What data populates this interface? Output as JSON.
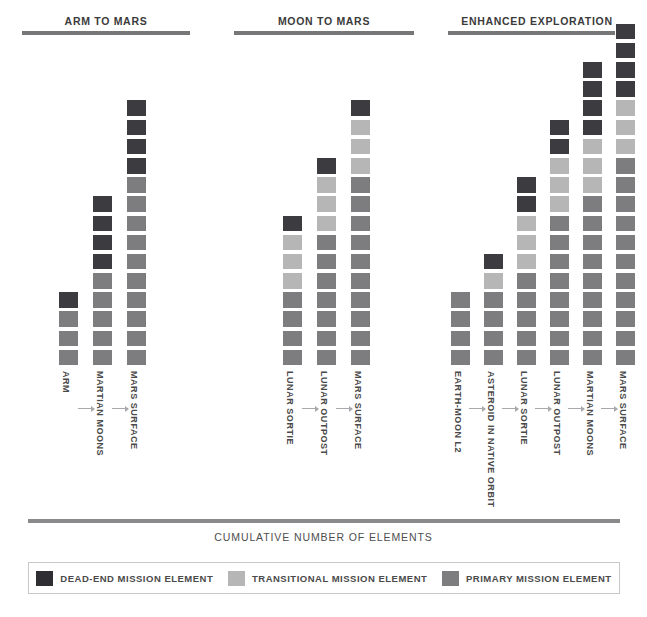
{
  "chart_data": {
    "type": "bar",
    "title": "",
    "xlabel": "CUMULATIVE NUMBER OF ELEMENTS",
    "ylabel": "",
    "stack_order_bottom_to_top": [
      "primary",
      "transitional",
      "deadend"
    ],
    "legend": {
      "position": "bottom",
      "entries": [
        {
          "key": "deadend",
          "label": "DEAD-END MISSION ELEMENT",
          "color": "#2f2f33"
        },
        {
          "key": "transitional",
          "label": "TRANSITIONAL MISSION ELEMENT",
          "color": "#b6b6b6"
        },
        {
          "key": "primary",
          "label": "PRIMARY MISSION ELEMENT",
          "color": "#7d7d7f"
        }
      ]
    },
    "groups": [
      {
        "title": "ARM TO MARS",
        "categories": [
          "ARM",
          "MARTIAN MOONS",
          "MARS SURFACE"
        ],
        "series": [
          {
            "name": "PRIMARY MISSION ELEMENT",
            "values": [
              3,
              5,
              10
            ]
          },
          {
            "name": "TRANSITIONAL MISSION ELEMENT",
            "values": [
              0,
              0,
              0
            ]
          },
          {
            "name": "DEAD-END MISSION ELEMENT",
            "values": [
              1,
              4,
              4
            ]
          }
        ],
        "totals": [
          4,
          9,
          14
        ]
      },
      {
        "title": "MOON TO MARS",
        "categories": [
          "LUNAR SORTIE",
          "LUNAR OUTPOST",
          "MARS SURFACE"
        ],
        "series": [
          {
            "name": "PRIMARY MISSION ELEMENT",
            "values": [
              4,
              7,
              10
            ]
          },
          {
            "name": "TRANSITIONAL MISSION ELEMENT",
            "values": [
              3,
              3,
              3
            ]
          },
          {
            "name": "DEAD-END MISSION ELEMENT",
            "values": [
              1,
              1,
              1
            ]
          }
        ],
        "totals": [
          8,
          11,
          14
        ]
      },
      {
        "title": "ENHANCED EXPLORATION",
        "categories": [
          "EARTH-MOON L2",
          "ASTEROID IN NATIVE ORBIT",
          "LUNAR SORTIE",
          "LUNAR OUTPOST",
          "MARTIAN MOONS",
          "MARS SURFACE"
        ],
        "series": [
          {
            "name": "PRIMARY MISSION ELEMENT",
            "values": [
              4,
              4,
              5,
              8,
              9,
              11
            ]
          },
          {
            "name": "TRANSITIONAL MISSION ELEMENT",
            "values": [
              0,
              1,
              3,
              3,
              3,
              3
            ]
          },
          {
            "name": "DEAD-END MISSION ELEMENT",
            "values": [
              0,
              1,
              2,
              2,
              4,
              4
            ]
          }
        ],
        "totals": [
          4,
          6,
          10,
          13,
          16,
          18
        ]
      }
    ]
  },
  "headers": {
    "group_1": "ARM TO MARS",
    "group_2": "MOON TO MARS",
    "group_3": "ENHANCED EXPLORATION"
  },
  "axis": {
    "caption": "CUMULATIVE NUMBER OF ELEMENTS"
  },
  "legend": {
    "deadend_label": "DEAD-END MISSION ELEMENT",
    "transitional_label": "TRANSITIONAL MISSION ELEMENT",
    "primary_label": "PRIMARY MISSION ELEMENT"
  },
  "labels": {
    "g1": [
      "ARM",
      "MARTIAN MOONS",
      "MARS SURFACE"
    ],
    "g2": [
      "LUNAR SORTIE",
      "LUNAR OUTPOST",
      "MARS SURFACE"
    ],
    "g3": [
      "EARTH-MOON L2",
      "ASTEROID IN NATIVE ORBIT",
      "LUNAR SORTIE",
      "LUNAR OUTPOST",
      "MARTIAN MOONS",
      "MARS SURFACE"
    ]
  },
  "colors": {
    "primary": "#7d7d7f",
    "transitional": "#b6b6b6",
    "deadend": "#3c3c40",
    "rule": "#77777a",
    "text": "#4a4a4a"
  }
}
